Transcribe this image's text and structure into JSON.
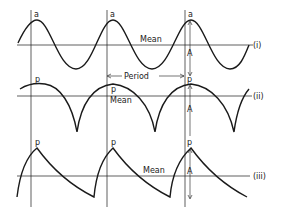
{
  "figure": {
    "colors": {
      "ink": "#1a1a1a",
      "background": "#ffffff"
    },
    "rows": [
      {
        "id": "i",
        "label": "(i)",
        "shape": "sinusoid",
        "peak_label": "a",
        "mean_label": "Mean",
        "amplitude_label": "A"
      },
      {
        "id": "ii",
        "label": "(ii)",
        "shape": "rectified sine (cusped)",
        "peak_label": "p",
        "mean_label": "Mean",
        "amplitude_label": "A"
      },
      {
        "id": "iii",
        "label": "(iii)",
        "shape": "sawtooth with exponential decay",
        "peak_label": "p",
        "mean_label": "Mean",
        "amplitude_label": "A"
      }
    ],
    "period_label": "Period"
  }
}
